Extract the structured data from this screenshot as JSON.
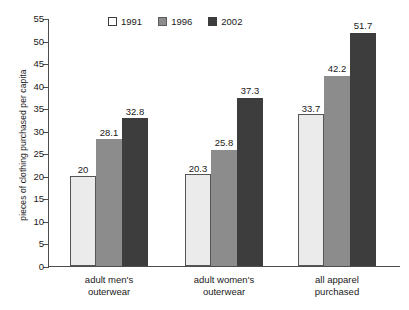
{
  "chart_data": {
    "type": "bar",
    "title": "",
    "subtitle": "",
    "xlabel": "",
    "ylabel": "pieces of clothing purchased per capita",
    "ylim": [
      0,
      55
    ],
    "y_ticks": [
      0,
      5,
      10,
      15,
      20,
      25,
      30,
      35,
      40,
      45,
      50,
      55
    ],
    "grid": false,
    "legend_position": "top-center",
    "categories": [
      "adult men's outerwear",
      "adult women's outerwear",
      "all apparel purchased"
    ],
    "category_lines": [
      [
        "adult men's",
        "outerwear"
      ],
      [
        "adult women's",
        "outerwear"
      ],
      [
        "all apparel",
        "purchased"
      ]
    ],
    "series": [
      {
        "name": "1991",
        "color": "#ebebeb",
        "values": [
          20,
          20.3,
          33.7
        ],
        "labels": [
          "20",
          "20.3",
          "33.7"
        ]
      },
      {
        "name": "1996",
        "color": "#8c8c8c",
        "values": [
          28.1,
          25.8,
          42.2
        ],
        "labels": [
          "28.1",
          "25.8",
          "42.2"
        ]
      },
      {
        "name": "2002",
        "color": "#3d3d3d",
        "values": [
          32.8,
          37.3,
          51.7
        ],
        "labels": [
          "32.8",
          "37.3",
          "51.7"
        ]
      }
    ]
  },
  "legend": {
    "items": [
      {
        "label": "1991",
        "swatch": "legend-swatch-1991"
      },
      {
        "label": "1996",
        "swatch": "legend-swatch-1996"
      },
      {
        "label": "2002",
        "swatch": "legend-swatch-2002"
      }
    ]
  }
}
